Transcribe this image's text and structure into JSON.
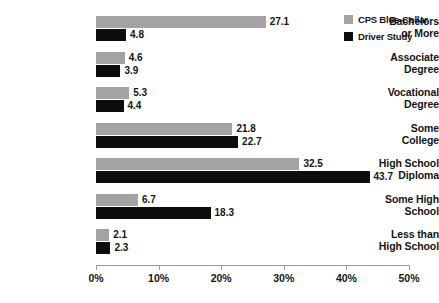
{
  "chart_data": {
    "type": "bar",
    "orientation": "horizontal",
    "title": "",
    "xlabel": "",
    "ylabel": "",
    "xlim": [
      0,
      50
    ],
    "grid": false,
    "legend_position": "top-right",
    "categories": [
      "Bachelors or More",
      "Associate Degree",
      "Vocational Degree",
      "Some College",
      "High School Diploma",
      "Some High School",
      "Less than High School"
    ],
    "category_lines": [
      [
        "Bachelors",
        "or More"
      ],
      [
        "Associate",
        "Degree"
      ],
      [
        "Vocational",
        "Degree"
      ],
      [
        "Some",
        "College"
      ],
      [
        "High School",
        "Diploma"
      ],
      [
        "Some High",
        "School"
      ],
      [
        "Less than",
        "High School"
      ]
    ],
    "series": [
      {
        "name": "CPS Blue-Collar",
        "color": "#a3a3a3",
        "values": [
          27.1,
          4.6,
          5.3,
          21.8,
          32.5,
          6.7,
          2.1
        ],
        "value_labels": [
          "27.1",
          "4.6",
          "5.3",
          "21.8",
          "32.5",
          "6.7",
          "2.1"
        ]
      },
      {
        "name": "Driver Study",
        "color": "#0d0d0d",
        "values": [
          4.8,
          3.9,
          4.4,
          22.7,
          43.7,
          18.3,
          2.3
        ],
        "value_labels": [
          "4.8",
          "3.9",
          "4.4",
          "22.7",
          "43.7",
          "18.3",
          "2.3"
        ]
      }
    ],
    "xticks": [
      0,
      10,
      20,
      30,
      40,
      50
    ],
    "xtick_labels": [
      "0%",
      "10%",
      "20%",
      "30%",
      "40%",
      "50%"
    ]
  },
  "legend": {
    "items": [
      {
        "label": "CPS Blue-Collar",
        "color": "#a3a3a3"
      },
      {
        "label": "Driver Study",
        "color": "#0d0d0d"
      }
    ]
  }
}
